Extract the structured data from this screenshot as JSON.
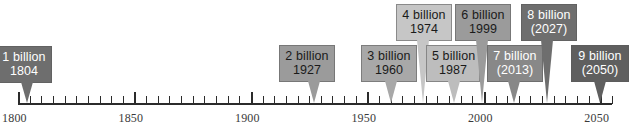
{
  "figure": {
    "width": 634,
    "height": 130,
    "background": "#ffffff"
  },
  "axis": {
    "line_color": "#2b2b2b",
    "year_start": 1800,
    "year_end": 2055,
    "pixel_start": 18,
    "pixel_end": 612,
    "baseline_y": 103,
    "minor_tick_step": 5,
    "major_tick_step": 50,
    "labels": [
      {
        "text": "1800",
        "year": 1800
      },
      {
        "text": "1850",
        "year": 1850
      },
      {
        "text": "1900",
        "year": 1900
      },
      {
        "text": "1950",
        "year": 1950
      },
      {
        "text": "2000",
        "year": 2000
      },
      {
        "text": "2050",
        "year": 2050
      }
    ]
  },
  "markers": [
    {
      "name": "milestone-1-billion",
      "line1": "1 billion",
      "line2": "1804",
      "year": 1804,
      "box_x": -4,
      "box_y": 46,
      "box_w": 56,
      "fill": "#6e6e6e",
      "text_color": "#ffffff",
      "pointer_color": "#6e6e6e",
      "pointer_height": 22
    },
    {
      "name": "milestone-2-billion",
      "line1": "2 billion",
      "line2": "1927",
      "year": 1927,
      "box_x": 279,
      "box_y": 45,
      "box_w": 56,
      "fill": "#9b9b9b",
      "text_color": "#1a1a1a",
      "pointer_color": "#9b9b9b",
      "pointer_height": 22
    },
    {
      "name": "milestone-3-billion",
      "line1": "3 billion",
      "line2": "1960",
      "year": 1960,
      "box_x": 361,
      "box_y": 45,
      "box_w": 56,
      "fill": "#a8a8a8",
      "text_color": "#1a1a1a",
      "pointer_color": "#a8a8a8",
      "pointer_height": 22
    },
    {
      "name": "milestone-4-billion",
      "line1": "4 billion",
      "line2": "1974",
      "year": 1974,
      "box_x": 396,
      "box_y": 4,
      "box_w": 56,
      "fill": "#c6c6c6",
      "text_color": "#1a1a1a",
      "pointer_color": "#c6c6c6",
      "pointer_height": 62
    },
    {
      "name": "milestone-5-billion",
      "line1": "5 billion",
      "line2": "1987",
      "year": 1987,
      "box_x": 426,
      "box_y": 45,
      "box_w": 54,
      "fill": "#bdbdbd",
      "text_color": "#1a1a1a",
      "pointer_color": "#bdbdbd",
      "pointer_height": 22
    },
    {
      "name": "milestone-6-billion",
      "line1": "6 billion",
      "line2": "1999",
      "year": 1999,
      "box_x": 455,
      "box_y": 4,
      "box_w": 56,
      "fill": "#9b9b9b",
      "text_color": "#1a1a1a",
      "pointer_color": "#9b9b9b",
      "pointer_height": 62
    },
    {
      "name": "milestone-7-billion",
      "line1": "7 billion",
      "line2": "(2013)",
      "year": 2013,
      "box_x": 487,
      "box_y": 45,
      "box_w": 56,
      "fill": "#888888",
      "text_color": "#ffffff",
      "pointer_color": "#888888",
      "pointer_height": 22
    },
    {
      "name": "milestone-8-billion",
      "line1": "8 billion",
      "line2": "(2027)",
      "year": 2027,
      "box_x": 521,
      "box_y": 4,
      "box_w": 56,
      "fill": "#6e6e6e",
      "text_color": "#ffffff",
      "pointer_color": "#6e6e6e",
      "pointer_height": 62
    },
    {
      "name": "milestone-9-billion",
      "line1": "9 billion",
      "line2": "(2050)",
      "year": 2050,
      "box_x": 571,
      "box_y": 45,
      "box_w": 58,
      "fill": "#5f5f5f",
      "text_color": "#ffffff",
      "pointer_color": "#5f5f5f",
      "pointer_height": 22
    }
  ],
  "chart_data": {
    "type": "timeline",
    "xlabel": "Year",
    "ylabel": "",
    "xlim": [
      1800,
      2055
    ],
    "grid": false,
    "legend": "none",
    "axis_tick_labels": [
      "1800",
      "1850",
      "1900",
      "1950",
      "2000",
      "2050"
    ],
    "minor_tick_interval_years": 5,
    "major_tick_interval_years": 50,
    "categories": [
      "1 billion",
      "2 billion",
      "3 billion",
      "4 billion",
      "5 billion",
      "6 billion",
      "7 billion",
      "8 billion",
      "9 billion"
    ],
    "x": [
      1804,
      1927,
      1960,
      1974,
      1987,
      1999,
      2013,
      2027,
      2050
    ],
    "values": [
      1,
      2,
      3,
      4,
      5,
      6,
      7,
      8,
      9
    ],
    "value_unit": "billion people",
    "annotations": [
      {
        "label": "1 billion",
        "year": 1804,
        "year_text": "1804",
        "projected": false
      },
      {
        "label": "2 billion",
        "year": 1927,
        "year_text": "1927",
        "projected": false
      },
      {
        "label": "3 billion",
        "year": 1960,
        "year_text": "1960",
        "projected": false
      },
      {
        "label": "4 billion",
        "year": 1974,
        "year_text": "1974",
        "projected": false
      },
      {
        "label": "5 billion",
        "year": 1987,
        "year_text": "1987",
        "projected": false
      },
      {
        "label": "6 billion",
        "year": 1999,
        "year_text": "1999",
        "projected": false
      },
      {
        "label": "7 billion",
        "year": 2013,
        "year_text": "(2013)",
        "projected": true
      },
      {
        "label": "8 billion",
        "year": 2027,
        "year_text": "(2027)",
        "projected": true
      },
      {
        "label": "9 billion",
        "year": 2050,
        "year_text": "(2050)",
        "projected": true
      }
    ]
  }
}
